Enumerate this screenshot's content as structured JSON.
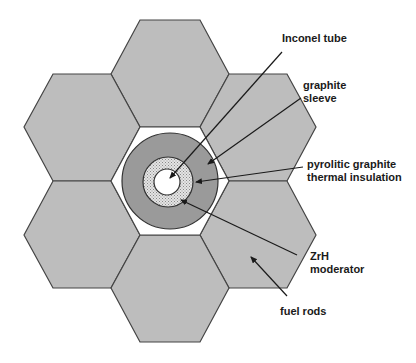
{
  "diagram": {
    "type": "fuel element cross-section (hexagonal lattice)",
    "colors": {
      "fuel_rod": "#bdbdbd",
      "outline": "#444444",
      "moderator_gap": "#ffffff",
      "graphite_sleeve": "#9a9a9a",
      "insulation": "#d6d6d6",
      "inconel_tube": "#ffffff",
      "arrow": "#1a1a1a"
    },
    "labels": {
      "inconel": "Inconel tube",
      "sleeve_line1": "graphite",
      "sleeve_line2": "sleeve",
      "pyro_line1": "pyrolitic graphite",
      "pyro_line2": "thermal insulation",
      "zrh_line1": "ZrH",
      "zrh_line2": "moderator",
      "fuel": "fuel rods"
    }
  }
}
